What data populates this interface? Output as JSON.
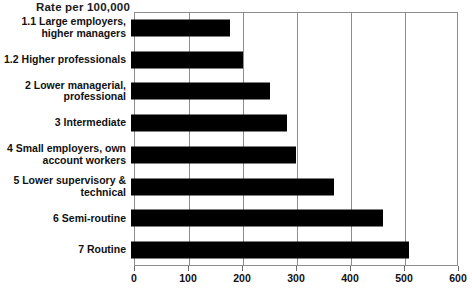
{
  "chart_data": {
    "type": "bar",
    "orientation": "horizontal",
    "title": "Rate per 100,000",
    "xlabel": "",
    "ylabel": "",
    "xlim": [
      0,
      600
    ],
    "xticks": [
      0,
      100,
      200,
      300,
      400,
      500,
      600
    ],
    "xtick_labels": [
      "0",
      "100",
      "200",
      "300",
      "400",
      "500",
      "600"
    ],
    "grid": true,
    "grid_axis": "x",
    "legend": false,
    "bar_color": "#000000",
    "categories": [
      "1.1 Large employers,\nhigher managers",
      "1.2 Higher professionals",
      "2 Lower managerial,\nprofessional",
      "3 Intermediate",
      "4 Small employers, own\naccount workers",
      "5 Lower supervisory &\ntechnical",
      "6 Semi-routine",
      "7 Routine"
    ],
    "values": [
      183,
      207,
      257,
      289,
      306,
      375,
      467,
      514
    ]
  }
}
